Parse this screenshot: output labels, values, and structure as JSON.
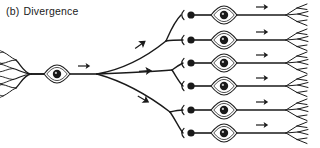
{
  "figure": {
    "panel_label": "(b)",
    "title": "Divergence",
    "caption_full": "(b) Divergence",
    "type": "neural-circuit-schematic",
    "background_color": "#ffffff",
    "ink_color": "#1a1a1a",
    "width": 320,
    "height": 148
  },
  "diagram": {
    "source_neuron": {
      "name": "presynaptic-neuron",
      "dendrite_tree_x": 6,
      "soma_center": [
        57,
        74
      ],
      "soma_rx": 13,
      "soma_ry": 9,
      "nucleus_radius": 4.2,
      "axon_start_x": 70,
      "axon_branch_node": [
        97,
        74
      ],
      "axon_arrow_x": 82
    },
    "branch_node": [
      97,
      74
    ],
    "target_count": 6,
    "targets": [
      {
        "index": 1,
        "row_y": 15,
        "bouton_x": 191,
        "synapse_cup_x": 184,
        "soma_center": [
          224,
          15
        ],
        "axon_arrow_x": 262,
        "terminal_fan_x": 286
      },
      {
        "index": 2,
        "row_y": 40,
        "bouton_x": 191,
        "synapse_cup_x": 184,
        "soma_center": [
          224,
          40
        ],
        "axon_arrow_x": 262,
        "terminal_fan_x": 286
      },
      {
        "index": 3,
        "row_y": 63,
        "bouton_x": 191,
        "synapse_cup_x": 184,
        "soma_center": [
          224,
          63
        ],
        "axon_arrow_x": 262,
        "terminal_fan_x": 286
      },
      {
        "index": 4,
        "row_y": 86,
        "bouton_x": 191,
        "synapse_cup_x": 184,
        "soma_center": [
          224,
          86
        ],
        "axon_arrow_x": 262,
        "terminal_fan_x": 286
      },
      {
        "index": 5,
        "row_y": 110,
        "bouton_x": 191,
        "synapse_cup_x": 184,
        "soma_center": [
          224,
          110
        ],
        "axon_arrow_x": 262,
        "terminal_fan_x": 286
      },
      {
        "index": 6,
        "row_y": 133,
        "bouton_x": 191,
        "synapse_cup_x": 184,
        "soma_center": [
          224,
          133
        ],
        "axon_arrow_x": 262,
        "terminal_fan_x": 286
      }
    ],
    "collateral_arrows": [
      {
        "x": 140,
        "y": 45,
        "angle": -36
      },
      {
        "x": 145,
        "y": 71,
        "angle": -4
      },
      {
        "x": 143,
        "y": 99,
        "angle": 30
      }
    ],
    "legend_semantics": {
      "filled_dot": "presynaptic-terminal-bouton",
      "cup": "postsynaptic-dendrite-cup",
      "lens_shape": "cell-body-soma",
      "dark_disc": "nucleus",
      "arrow": "direction-of-impulse-propagation"
    }
  }
}
